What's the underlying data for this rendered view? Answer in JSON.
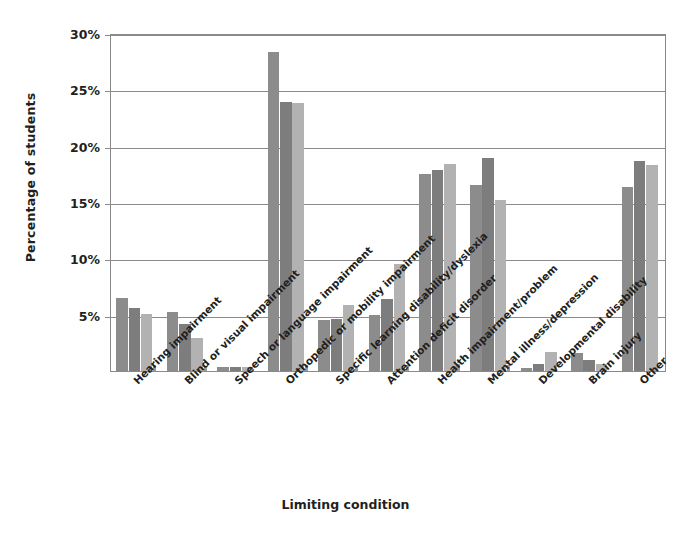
{
  "chart_data": {
    "type": "bar",
    "title": "",
    "xlabel": "Limiting condition",
    "ylabel": "Percentage of students",
    "ylim": [
      0,
      30
    ],
    "yticks": [
      0,
      5,
      10,
      15,
      20,
      25,
      30
    ],
    "ytick_labels": [
      "0%",
      "5%",
      "10%",
      "15%",
      "20%",
      "25%",
      "30%"
    ],
    "grid": true,
    "legend": "none",
    "categories": [
      "Hearing impairment",
      "Blind or visual impairment",
      "Speech or language impairment",
      "Orthopedic or mobility impairment",
      "Specific learning disability/dyslexia",
      "Attention deficit disorder",
      "Health impairment/problem",
      "Mental illness/depression",
      "Developmental disability",
      "Brain injury",
      "Other"
    ],
    "series": [
      {
        "name": "Series 1",
        "color": "#8c8c8c",
        "values": [
          6.5,
          5.2,
          0.35,
          28.3,
          4.5,
          5.0,
          17.5,
          16.5,
          0.3,
          1.6,
          16.3
        ]
      },
      {
        "name": "Series 2",
        "color": "#7d7d7d",
        "values": [
          5.6,
          4.2,
          0.4,
          23.9,
          4.6,
          6.4,
          17.8,
          18.9,
          0.6,
          1.0,
          18.6
        ]
      },
      {
        "name": "Series 3",
        "color": "#b2b2b2",
        "values": [
          5.1,
          2.9,
          0.35,
          23.8,
          5.9,
          9.5,
          18.4,
          15.2,
          1.7,
          0.6,
          18.3
        ]
      },
      {
        "name": "Series 4",
        "color": "#9a9a9a",
        "values": [
          0.5,
          0.45,
          0.0,
          0.55,
          0.45,
          0.55,
          0.6,
          0.5,
          0.0,
          0.0,
          0.0
        ]
      }
    ]
  }
}
